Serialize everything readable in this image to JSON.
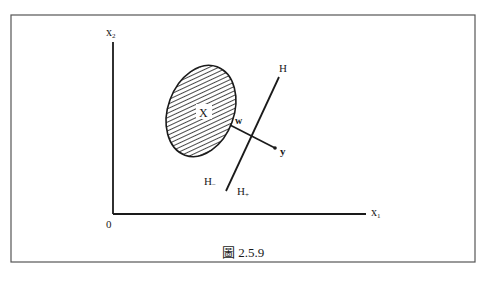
{
  "figure": {
    "caption": "圖 2.5.9",
    "axes": {
      "x_label": "x",
      "x_sub": "1",
      "y_label": "x",
      "y_sub": "2",
      "origin_label": "0"
    },
    "set": {
      "label": "X",
      "description": "hatched convex set"
    },
    "hyperplane": {
      "label": "H",
      "minus_side_label": "H",
      "minus_side_sub": "−",
      "plus_side_label": "H",
      "plus_side_sub": "+"
    },
    "points": {
      "w_label": "w",
      "y_label": "y"
    },
    "colors": {
      "ink": "#1a1a1a",
      "frame": "#555555",
      "background": "#ffffff"
    }
  }
}
